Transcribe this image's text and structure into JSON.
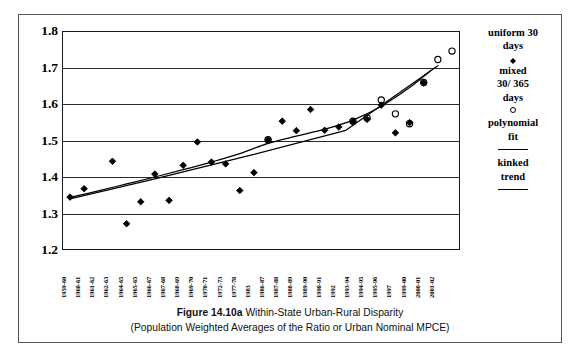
{
  "figure": {
    "caption_figure_number": "Figure 14.10a",
    "caption_title": "Within-State Urban-Rural Disparity",
    "caption_subtitle": "(Population Weighted Averages of the Ratio or Urban Nominal MPCE)"
  },
  "legend": {
    "items": [
      {
        "label": "uniform 30 days",
        "marker": "filled-diamond-marker"
      },
      {
        "label": "mixed 30/ 365 days",
        "marker": "open-circle-marker"
      },
      {
        "label": "polynomial fit",
        "marker": "line-marker"
      },
      {
        "label": "kinked trend",
        "marker": "line-marker"
      }
    ],
    "uniform_label_line1": "uniform 30",
    "uniform_label_line2": "days",
    "mixed_label_line1": "mixed",
    "mixed_label_line2": "30/ 365",
    "mixed_label_line3": "days",
    "poly_label_line1": "polynomial",
    "poly_label_line2": "fit",
    "kinked_label_line1": "kinked",
    "kinked_label_line2": "trend"
  },
  "colors": {
    "marker": "#000000",
    "axis": "#1a1a1a",
    "grid": "#2a2a2a",
    "frame": "#555555",
    "background": "#ffffff"
  },
  "chart_data": {
    "type": "scatter",
    "title": "Figure 14.10a Within-State Urban-Rural Disparity",
    "subtitle": "(Population Weighted Averages of the Ratio or Urban Nominal MPCE)",
    "xlabel": "",
    "ylabel": "",
    "ylim": [
      1.2,
      1.8
    ],
    "yticks": [
      "1.2",
      "1.3",
      "1.4",
      "1.5",
      "1.6",
      "1.7",
      "1.8"
    ],
    "grid": true,
    "legend_position": "right",
    "categories": [
      "1959-60",
      "1960-61",
      "1961-62",
      "1962-63",
      "1964-65",
      "1965-65",
      "1966-67",
      "1967-68",
      "1968-69",
      "1969-70",
      "1970-71",
      "1972-73",
      "1977-78",
      "1983",
      "1986-87",
      "1987-88",
      "1988-89",
      "1989-90",
      "1990-91",
      "1992",
      "1993-94",
      "1994-95",
      "1995-96",
      "1997",
      "1999-00",
      "2000-01",
      "2001-02"
    ],
    "series": [
      {
        "name": "uniform 30 days",
        "marker": "filled-diamond",
        "points": [
          {
            "x": "1959-60",
            "xi": 0,
            "y": 1.345
          },
          {
            "x": "1960-61",
            "xi": 1,
            "y": 1.368
          },
          {
            "x": "1962-63",
            "xi": 3,
            "y": 1.443
          },
          {
            "x": "1964-65",
            "xi": 4,
            "y": 1.272
          },
          {
            "x": "1965-65",
            "xi": 5,
            "y": 1.332
          },
          {
            "x": "1966-67",
            "xi": 6,
            "y": 1.408
          },
          {
            "x": "1967-68",
            "xi": 7,
            "y": 1.336
          },
          {
            "x": "1968-69",
            "xi": 8,
            "y": 1.432
          },
          {
            "x": "1969-70",
            "xi": 9,
            "y": 1.496
          },
          {
            "x": "1970-71",
            "xi": 10,
            "y": 1.441
          },
          {
            "x": "1972-73",
            "xi": 11,
            "y": 1.436
          },
          {
            "x": "1977-78",
            "xi": 12,
            "y": 1.363
          },
          {
            "x": "1983",
            "xi": 13,
            "y": 1.412
          },
          {
            "x": "1986-87",
            "xi": 14,
            "y": 1.502
          },
          {
            "x": "1987-88",
            "xi": 15,
            "y": 1.553
          },
          {
            "x": "1988-89",
            "xi": 16,
            "y": 1.527
          },
          {
            "x": "1989-90",
            "xi": 17,
            "y": 1.585
          },
          {
            "x": "1990-91",
            "xi": 18,
            "y": 1.528
          },
          {
            "x": "1992",
            "xi": 19,
            "y": 1.537
          },
          {
            "x": "1993-94",
            "xi": 20,
            "y": 1.552
          },
          {
            "x": "1994-95",
            "xi": 21,
            "y": 1.558
          },
          {
            "x": "1995-96",
            "xi": 22,
            "y": 1.597
          },
          {
            "x": "1997",
            "xi": 23,
            "y": 1.521
          },
          {
            "x": "1999-00",
            "xi": 24,
            "y": 1.549
          },
          {
            "x": "2000-01",
            "xi": 25,
            "y": 1.658
          }
        ]
      },
      {
        "name": "mixed 30/ 365 days",
        "marker": "open-circle",
        "points": [
          {
            "x": "1986-87",
            "xi": 14,
            "y": 1.502
          },
          {
            "x": "1993-94",
            "xi": 20,
            "y": 1.553
          },
          {
            "x": "1994-95",
            "xi": 21,
            "y": 1.562
          },
          {
            "x": "1995-96",
            "xi": 22,
            "y": 1.611
          },
          {
            "x": "1997",
            "xi": 23,
            "y": 1.573
          },
          {
            "x": "1999-00",
            "xi": 24,
            "y": 1.546
          },
          {
            "x": "2000-01",
            "xi": 25,
            "y": 1.659
          },
          {
            "x": "2001-02",
            "xi": 26,
            "y": 1.722
          },
          {
            "x": "2001-02",
            "xi": 27,
            "y": 1.745
          }
        ]
      }
    ],
    "fit_curves": [
      {
        "name": "polynomial fit",
        "style": "solid-line",
        "points": [
          {
            "xi": 0.0,
            "y": 1.344
          },
          {
            "xi": 2.0,
            "y": 1.362
          },
          {
            "xi": 4.0,
            "y": 1.381
          },
          {
            "xi": 6.0,
            "y": 1.4
          },
          {
            "xi": 8.0,
            "y": 1.42
          },
          {
            "xi": 10.0,
            "y": 1.441
          },
          {
            "xi": 12.0,
            "y": 1.464
          },
          {
            "xi": 14.0,
            "y": 1.492
          },
          {
            "xi": 16.0,
            "y": 1.512
          },
          {
            "xi": 18.0,
            "y": 1.531
          },
          {
            "xi": 20.0,
            "y": 1.556
          },
          {
            "xi": 22.0,
            "y": 1.594
          },
          {
            "xi": 24.0,
            "y": 1.645
          },
          {
            "xi": 25.5,
            "y": 1.692
          }
        ]
      },
      {
        "name": "kinked trend",
        "style": "solid-line",
        "points": [
          {
            "xi": 0.0,
            "y": 1.34
          },
          {
            "xi": 6.0,
            "y": 1.395
          },
          {
            "xi": 13.0,
            "y": 1.462
          },
          {
            "xi": 19.5,
            "y": 1.528
          },
          {
            "xi": 26.0,
            "y": 1.705
          }
        ]
      }
    ]
  }
}
